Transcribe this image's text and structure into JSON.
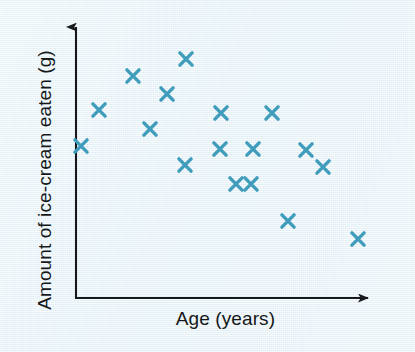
{
  "chart_data": {
    "type": "scatter",
    "title": "",
    "xlabel": "Age (years)",
    "ylabel": "Amount of ice-cream eaten (g)",
    "grid": false,
    "legend": null,
    "axis_style": "arrow-headed L-shaped axes, no tick marks, no tick labels",
    "marker": "x",
    "marker_color": "#3f9dbb",
    "background_color": "#eaf4f8",
    "axis_color": "#17191b",
    "label_color": "#15181a",
    "xlim": [
      0,
      100
    ],
    "ylim": [
      0,
      100
    ],
    "x_tick_labels": [],
    "y_tick_labels": [],
    "n_points": 21,
    "relationship": "negative correlation",
    "points": [
      {
        "x": 1,
        "y": 72
      },
      {
        "x": 7,
        "y": 85
      },
      {
        "x": 19,
        "y": 98
      },
      {
        "x": 25,
        "y": 93
      },
      {
        "x": 37,
        "y": 100
      },
      {
        "x": 31,
        "y": 86
      },
      {
        "x": 25,
        "y": 76
      },
      {
        "x": 37,
        "y": 63
      },
      {
        "x": 48,
        "y": 77
      },
      {
        "x": 48,
        "y": 64
      },
      {
        "x": 59,
        "y": 64
      },
      {
        "x": 70,
        "y": 77
      },
      {
        "x": 54,
        "y": 52
      },
      {
        "x": 59,
        "y": 52
      },
      {
        "x": 81,
        "y": 63
      },
      {
        "x": 82,
        "y": 63
      },
      {
        "x": 87,
        "y": 57
      },
      {
        "x": 71,
        "y": 34
      },
      {
        "x": 94,
        "y": 27
      }
    ],
    "pixel_points": [
      {
        "cx": 81,
        "cy": 146
      },
      {
        "cx": 99,
        "cy": 110
      },
      {
        "cx": 133,
        "cy": 76
      },
      {
        "cx": 150,
        "cy": 129
      },
      {
        "cx": 167,
        "cy": 94
      },
      {
        "cx": 186,
        "cy": 59
      },
      {
        "cx": 185,
        "cy": 165
      },
      {
        "cx": 221,
        "cy": 113
      },
      {
        "cx": 220,
        "cy": 149
      },
      {
        "cx": 236,
        "cy": 184
      },
      {
        "cx": 251,
        "cy": 184
      },
      {
        "cx": 253,
        "cy": 149
      },
      {
        "cx": 272,
        "cy": 113
      },
      {
        "cx": 288,
        "cy": 221
      },
      {
        "cx": 306,
        "cy": 150
      },
      {
        "cx": 323,
        "cy": 167
      },
      {
        "cx": 358,
        "cy": 239
      }
    ]
  },
  "axes": {
    "x_label": "Age (years)",
    "y_label": "Amount of ice-cream eaten (g)"
  }
}
